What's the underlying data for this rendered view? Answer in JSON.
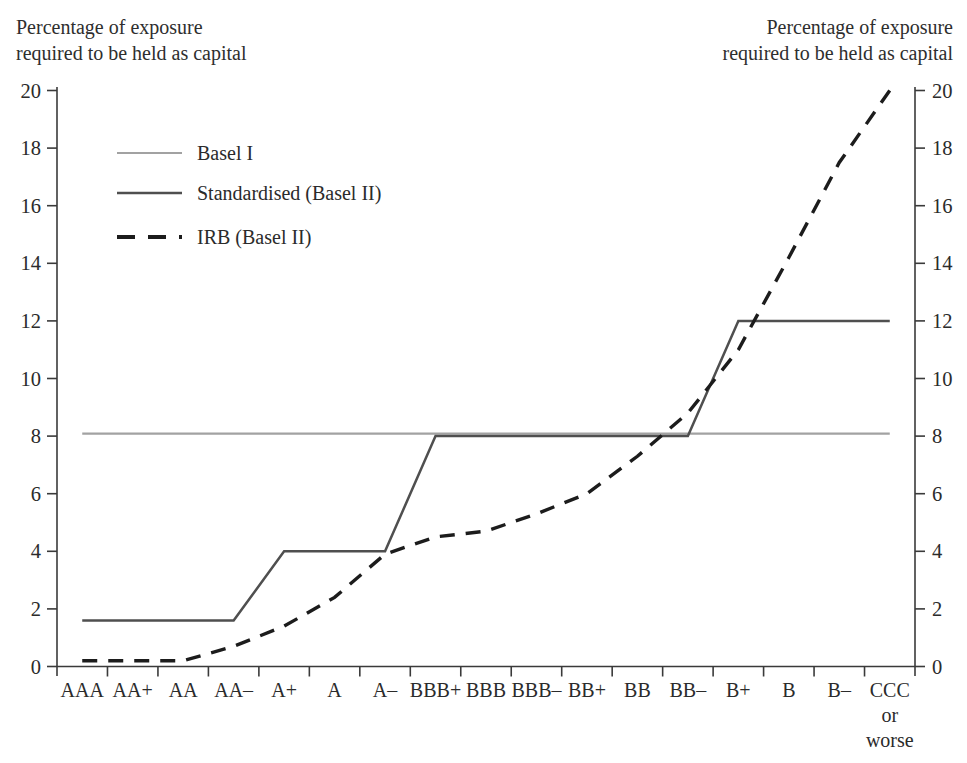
{
  "axis_title": {
    "line1": "Percentage of exposure",
    "line2": "required to be held as capital"
  },
  "chart_data": {
    "type": "line",
    "ylabel_left": "Percentage of exposure required to be held as capital",
    "ylabel_right": "Percentage of exposure required to be held as capital",
    "categories": [
      "AAA",
      "AA+",
      "AA",
      "AA–",
      "A+",
      "A",
      "A–",
      "BBB+",
      "BBB",
      "BBB–",
      "BB+",
      "BB",
      "BB–",
      "B+",
      "B",
      "B–",
      [
        "CCC",
        "or",
        "worse"
      ]
    ],
    "series": [
      {
        "name": "Basel I",
        "values": [
          8,
          8,
          8,
          8,
          8,
          8,
          8,
          8,
          8,
          8,
          8,
          8,
          8,
          8,
          8,
          8,
          8
        ],
        "color": "#a2a2a2",
        "dash": "none",
        "width": 2.2,
        "offset_px": -2.5
      },
      {
        "name": "Standardised (Basel II)",
        "values": [
          1.6,
          1.6,
          1.6,
          1.6,
          4,
          4,
          4,
          8,
          8,
          8,
          8,
          8,
          8,
          12,
          12,
          12,
          12
        ],
        "color": "#4f4f4f",
        "dash": "none",
        "width": 2.5,
        "offset_px": 0
      },
      {
        "name": "IRB (Basel II)",
        "values": [
          0.2,
          0.2,
          0.2,
          0.7,
          1.4,
          2.4,
          3.9,
          4.5,
          4.7,
          5.3,
          6,
          7.3,
          8.8,
          11,
          14.2,
          17.5,
          20
        ],
        "color": "#1c1c1c",
        "dash": "15 11",
        "width": 3.4,
        "offset_px": 0
      }
    ],
    "ylim": [
      0,
      20
    ],
    "ytick_step": 2,
    "yticks": [
      0,
      2,
      4,
      6,
      8,
      10,
      12,
      14,
      16,
      18,
      20
    ],
    "grid": "off",
    "legend_position": "upper-left-inside",
    "legend": [
      "Basel I",
      "Standardised (Basel II)",
      "IRB (Basel II)"
    ]
  }
}
